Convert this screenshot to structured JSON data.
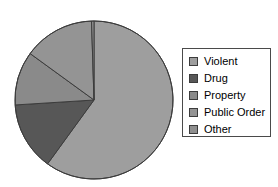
{
  "chart_data": {
    "type": "pie",
    "title": "",
    "xlabel": "",
    "ylabel": "",
    "legend_position": "right",
    "grid": false,
    "start_angle_deg": 0,
    "direction": "clockwise",
    "categories": [
      "Violent",
      "Drug",
      "Property",
      "Public Order",
      "Other"
    ],
    "values": [
      60.0,
      14.0,
      11.0,
      14.5,
      0.5
    ],
    "units": "percent",
    "colors": [
      "#9e9e9e",
      "#575757",
      "#8a8a8a",
      "#949494",
      "#8f8f8f"
    ],
    "slices": [
      {
        "label": "Violent",
        "value": 60.0,
        "color": "#9e9e9e",
        "start_deg": 0,
        "end_deg": 216
      },
      {
        "label": "Drug",
        "value": 14.0,
        "color": "#575757",
        "start_deg": 216,
        "end_deg": 266.4
      },
      {
        "label": "Property",
        "value": 11.0,
        "color": "#8a8a8a",
        "start_deg": 266.4,
        "end_deg": 306
      },
      {
        "label": "Public Order",
        "value": 14.5,
        "color": "#949494",
        "start_deg": 306,
        "end_deg": 358.2
      },
      {
        "label": "Other",
        "value": 0.5,
        "color": "#8f8f8f",
        "start_deg": 358.2,
        "end_deg": 360
      }
    ]
  },
  "pie": {
    "center_x": 94,
    "center_y": 100,
    "radius": 79,
    "outline_color": "#3c3c3c"
  },
  "legend": {
    "items": [
      {
        "label": "Violent",
        "color": "#9e9e9e"
      },
      {
        "label": "Drug",
        "color": "#575757"
      },
      {
        "label": "Property",
        "color": "#8a8a8a"
      },
      {
        "label": "Public Order",
        "color": "#949494"
      },
      {
        "label": "Other",
        "color": "#8f8f8f"
      }
    ],
    "border_color": "#4a4a4a",
    "background": "#ffffff"
  }
}
